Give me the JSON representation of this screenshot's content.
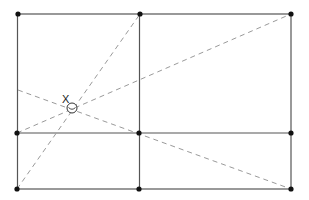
{
  "diagram": {
    "point_label": "X",
    "colors": {
      "solid_line": "#555555",
      "dashed_line": "#9a9a9a",
      "vertex": "#111111"
    },
    "vertices": [
      {
        "id": "top-left",
        "x": 18,
        "y": 14
      },
      {
        "id": "top-middle",
        "x": 140,
        "y": 14
      },
      {
        "id": "top-right",
        "x": 291,
        "y": 14
      },
      {
        "id": "mid-left",
        "x": 17,
        "y": 133
      },
      {
        "id": "mid-center",
        "x": 139,
        "y": 133
      },
      {
        "id": "mid-right",
        "x": 291,
        "y": 133
      },
      {
        "id": "bottom-left",
        "x": 17,
        "y": 189
      },
      {
        "id": "bottom-middle",
        "x": 139,
        "y": 189
      },
      {
        "id": "bottom-right",
        "x": 291,
        "y": 189
      }
    ],
    "marker": {
      "x": 72,
      "y": 108,
      "r": 5
    }
  }
}
